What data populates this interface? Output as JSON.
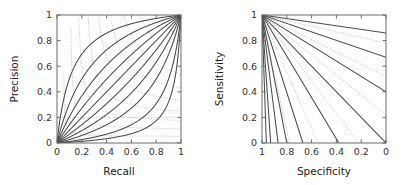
{
  "figure": {
    "background": "#ffffff",
    "curve_color": "#4a4a4a",
    "grid_color": "#b9b9b9",
    "axis_color": "#6b6b6b"
  },
  "chart_data": [
    {
      "id": "precision-recall",
      "type": "line",
      "title": "",
      "xlabel": "Recall",
      "ylabel": "Precision",
      "xlim": [
        0,
        1
      ],
      "ylim": [
        0,
        1
      ],
      "xticks": [
        0,
        0.2,
        0.4,
        0.6,
        0.8,
        1
      ],
      "yticks": [
        0,
        0.2,
        0.4,
        0.6,
        0.8,
        1
      ],
      "xticklabels": [
        "0",
        "0.2",
        "0.4",
        "0.6",
        "0.8",
        "1"
      ],
      "yticklabels": [
        "0",
        "0.2",
        "0.4",
        "0.6",
        "0.8",
        "1"
      ],
      "x_reversed": false,
      "y_reversed": false,
      "grid": "dotted-iso-f-contours",
      "legend": "none",
      "annotations": [],
      "series": [
        {
          "name": "prevalence 0.9",
          "beta": 0.11,
          "values_note": "precision = r/(r + beta*(1-r)) family"
        },
        {
          "name": "prevalence 0.8",
          "beta": 0.25
        },
        {
          "name": "prevalence 0.7",
          "beta": 0.43
        },
        {
          "name": "prevalence 0.6",
          "beta": 0.67
        },
        {
          "name": "prevalence 0.5",
          "beta": 1.0
        },
        {
          "name": "prevalence 0.4",
          "beta": 1.5
        },
        {
          "name": "prevalence 0.3",
          "beta": 2.33
        },
        {
          "name": "prevalence 0.2",
          "beta": 4.0
        },
        {
          "name": "prevalence 0.1",
          "beta": 9.0
        },
        {
          "name": "prevalence 0.05",
          "beta": 19.0
        }
      ],
      "iso_contours": {
        "label": "iso-F1 dotted contours",
        "f_values": [
          0.1,
          0.2,
          0.3,
          0.4,
          0.5,
          0.6,
          0.7,
          0.8,
          0.9
        ]
      }
    },
    {
      "id": "roc-sensitivity-specificity",
      "type": "line",
      "title": "",
      "xlabel": "Specificity",
      "ylabel": "Sensitivity",
      "xlim": [
        1,
        0
      ],
      "ylim": [
        0,
        1
      ],
      "xticks": [
        1,
        0.8,
        0.6,
        0.4,
        0.2,
        0
      ],
      "yticks": [
        0,
        0.2,
        0.4,
        0.6,
        0.8,
        1
      ],
      "xticklabels": [
        "1",
        "0.8",
        "0.6",
        "0.4",
        "0.2",
        "0"
      ],
      "yticklabels": [
        "0",
        "0.2",
        "0.4",
        "0.6",
        "0.8",
        "1"
      ],
      "x_reversed": true,
      "y_reversed": false,
      "grid": "dotted-iso-contours",
      "legend": "none",
      "annotations": [],
      "series": [
        {
          "name": "line 1",
          "from": [
            1,
            1
          ],
          "to": [
            0.0,
            0.86
          ]
        },
        {
          "name": "line 2",
          "from": [
            1,
            1
          ],
          "to": [
            0.0,
            0.67
          ]
        },
        {
          "name": "line 3",
          "from": [
            1,
            1
          ],
          "to": [
            0.0,
            0.4
          ]
        },
        {
          "name": "line 4",
          "from": [
            1,
            1
          ],
          "to": [
            0.0,
            0.0
          ]
        },
        {
          "name": "line 5",
          "from": [
            1,
            1
          ],
          "to": [
            0.38,
            0.0
          ]
        },
        {
          "name": "line 6",
          "from": [
            1,
            1
          ],
          "to": [
            0.67,
            0.0
          ]
        },
        {
          "name": "line 7",
          "from": [
            1,
            1
          ],
          "to": [
            0.8,
            0.0
          ]
        },
        {
          "name": "line 8",
          "from": [
            1,
            1
          ],
          "to": [
            0.87,
            0.0
          ]
        },
        {
          "name": "line 9",
          "from": [
            1,
            1
          ],
          "to": [
            0.93,
            0.0
          ]
        },
        {
          "name": "line 10",
          "from": [
            1,
            1
          ],
          "to": [
            0.965,
            0.0
          ]
        }
      ],
      "iso_contours": {
        "label": "dotted diagonal iso-performance contours",
        "count": 6
      }
    }
  ]
}
